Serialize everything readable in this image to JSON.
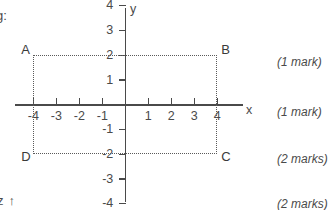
{
  "page": {
    "fragment_top_left": "g:",
    "fragment_bottom_left": "z",
    "fragment_bottom_left_icon": "up-arrow-icon",
    "arrow_glyph": "↑"
  },
  "graph": {
    "x_axis_label": "x",
    "y_axis_label": "y",
    "x_ticks": [
      {
        "value": -4,
        "label": "-4"
      },
      {
        "value": -3,
        "label": "-3"
      },
      {
        "value": -2,
        "label": "-2"
      },
      {
        "value": -1,
        "label": "-1"
      },
      {
        "value": 1,
        "label": "1"
      },
      {
        "value": 2,
        "label": "2"
      },
      {
        "value": 3,
        "label": "3"
      },
      {
        "value": 4,
        "label": "4"
      }
    ],
    "y_ticks": [
      {
        "value": 4,
        "label": "4"
      },
      {
        "value": 3,
        "label": "3"
      },
      {
        "value": 2,
        "label": "2"
      },
      {
        "value": 1,
        "label": "1"
      },
      {
        "value": -1,
        "label": "-1"
      },
      {
        "value": -2,
        "label": "-2"
      },
      {
        "value": -3,
        "label": "-3"
      },
      {
        "value": -4,
        "label": "-4"
      }
    ],
    "vertices": [
      {
        "name": "A",
        "label": "A",
        "x": -4,
        "y": 2
      },
      {
        "name": "B",
        "label": "B",
        "x": 4,
        "y": 2
      },
      {
        "name": "C",
        "label": "C",
        "x": 4,
        "y": -2
      },
      {
        "name": "D",
        "label": "D",
        "x": -4,
        "y": -2
      }
    ],
    "shape": {
      "type": "rectangle",
      "line_style": "dotted",
      "corners": [
        [
          -4,
          2
        ],
        [
          4,
          2
        ],
        [
          4,
          -2
        ],
        [
          -4,
          -2
        ]
      ]
    },
    "colors": {
      "axis": "#4a4a4a",
      "shape": "#5a5a5a",
      "text": "#3a3a3a"
    }
  },
  "chart_data": {
    "type": "scatter",
    "title": "",
    "xlabel": "x",
    "ylabel": "y",
    "xlim": [
      -4.8,
      5.2
    ],
    "ylim": [
      -4.2,
      4.4
    ],
    "grid": false,
    "xticks": [
      -4,
      -3,
      -2,
      -1,
      1,
      2,
      3,
      4
    ],
    "yticks": [
      4,
      3,
      2,
      1,
      -1,
      -2,
      -3,
      -4
    ],
    "annotations": [
      {
        "label": "A",
        "x": -4,
        "y": 2
      },
      {
        "label": "B",
        "x": 4,
        "y": 2
      },
      {
        "label": "C",
        "x": 4,
        "y": -2
      },
      {
        "label": "D",
        "x": -4,
        "y": -2
      }
    ],
    "series": [
      {
        "name": "rectangle ABCD",
        "style": "dotted",
        "x": [
          -4,
          4,
          4,
          -4,
          -4
        ],
        "y": [
          2,
          2,
          -2,
          -2,
          2
        ]
      }
    ]
  },
  "marks": [
    {
      "text": "(1 mark)",
      "top": 55
    },
    {
      "text": "(1 mark)",
      "top": 105
    },
    {
      "text": "(2 marks)",
      "top": 152
    },
    {
      "text": "(2 marks)",
      "top": 197
    }
  ]
}
